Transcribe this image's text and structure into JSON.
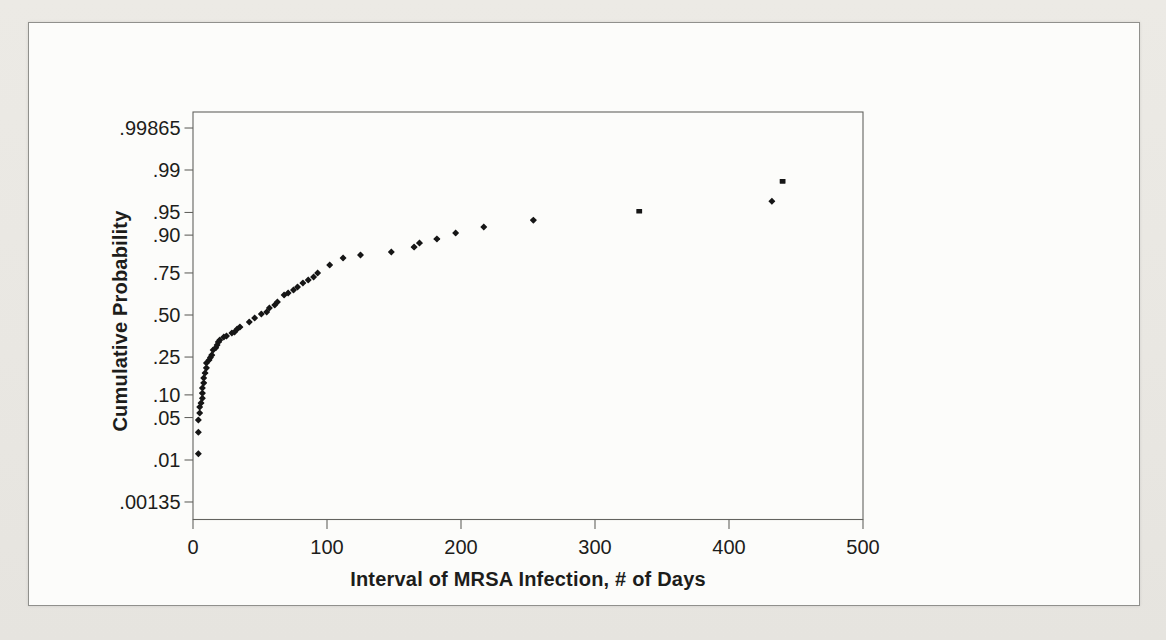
{
  "page": {
    "background": "#e9e7e2",
    "figure": {
      "background": "#fcfcfa",
      "border_color": "#90908c"
    }
  },
  "chart_data": {
    "type": "scatter",
    "title": "",
    "xlabel": "Interval of MRSA Infection, # of Days",
    "ylabel": "Cumulative Probability",
    "x_ticks": [
      0,
      100,
      200,
      300,
      400,
      500
    ],
    "xlim": [
      0,
      500
    ],
    "y_scale": "normal-probability",
    "grid": false,
    "legend": "none",
    "colors": {
      "marker": "#161616",
      "axis": "#63635f",
      "text": "#1d1d1b"
    },
    "y_ticks": [
      {
        "label": ".00135",
        "value": 0.00135
      },
      {
        "label": ".01",
        "value": 0.01
      },
      {
        "label": ".05",
        "value": 0.05
      },
      {
        "label": ".10",
        "value": 0.1
      },
      {
        "label": ".25",
        "value": 0.25
      },
      {
        "label": ".50",
        "value": 0.5
      },
      {
        "label": ".75",
        "value": 0.75
      },
      {
        "label": ".90",
        "value": 0.9
      },
      {
        "label": ".95",
        "value": 0.95
      },
      {
        "label": ".99",
        "value": 0.99
      },
      {
        "label": ".99865",
        "value": 0.99865
      }
    ],
    "points": [
      [
        4,
        0.013
      ],
      [
        4,
        0.03
      ],
      [
        4,
        0.046
      ],
      [
        5,
        0.058
      ],
      [
        5,
        0.07
      ],
      [
        6,
        0.079
      ],
      [
        7,
        0.091
      ],
      [
        7,
        0.105
      ],
      [
        7,
        0.121
      ],
      [
        8,
        0.138
      ],
      [
        8,
        0.156
      ],
      [
        9,
        0.176
      ],
      [
        10,
        0.198
      ],
      [
        10,
        0.221
      ],
      [
        12,
        0.235
      ],
      [
        13,
        0.248
      ],
      [
        14,
        0.26
      ],
      [
        15,
        0.287
      ],
      [
        17,
        0.3
      ],
      [
        18,
        0.315
      ],
      [
        19,
        0.333
      ],
      [
        20,
        0.344
      ],
      [
        23,
        0.362
      ],
      [
        25,
        0.368
      ],
      [
        29,
        0.386
      ],
      [
        31,
        0.392
      ],
      [
        33,
        0.411
      ],
      [
        35,
        0.423
      ],
      [
        42,
        0.455
      ],
      [
        46,
        0.481
      ],
      [
        51,
        0.506
      ],
      [
        55,
        0.519
      ],
      [
        57,
        0.545
      ],
      [
        61,
        0.564
      ],
      [
        63,
        0.583
      ],
      [
        68,
        0.626
      ],
      [
        71,
        0.638
      ],
      [
        75,
        0.656
      ],
      [
        78,
        0.673
      ],
      [
        82,
        0.696
      ],
      [
        86,
        0.713
      ],
      [
        90,
        0.729
      ],
      [
        93,
        0.75
      ],
      [
        102,
        0.789
      ],
      [
        112,
        0.82
      ],
      [
        125,
        0.832
      ],
      [
        148,
        0.844
      ],
      [
        165,
        0.862
      ],
      [
        169,
        0.876
      ],
      [
        182,
        0.889
      ],
      [
        196,
        0.906
      ],
      [
        217,
        0.921
      ],
      [
        254,
        0.936
      ],
      [
        333,
        0.952,
        "s"
      ],
      [
        432,
        0.966
      ],
      [
        440,
        0.984,
        "s"
      ]
    ]
  }
}
